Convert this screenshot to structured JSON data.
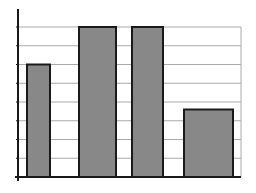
{
  "chart_data": {
    "type": "bar",
    "title": "",
    "xlabel": "",
    "ylabel": "",
    "categories": [
      "1",
      "2",
      "3",
      "4"
    ],
    "values": [
      6.0,
      8.0,
      8.0,
      3.6
    ],
    "ylim": [
      0,
      8
    ],
    "grid": true,
    "gridlines_count": 8,
    "legend": null,
    "tick_labels_visible": false
  },
  "style": {
    "bar_fill": "#888888",
    "bar_stroke": "#1a1a1a",
    "grid_color": "#aaaaaa",
    "axis_color": "#1a1a1a",
    "background": "#ffffff"
  }
}
